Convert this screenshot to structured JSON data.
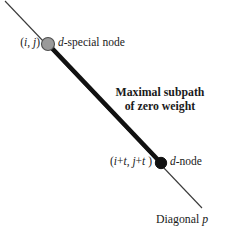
{
  "figure": {
    "background_color": "#ffffff",
    "width": 230,
    "height": 233
  },
  "diagonal": {
    "label_prefix": "Diagonal",
    "label_variable": "p",
    "thin_line_color": "#3a3a3a",
    "thin_line_width": 1,
    "start": {
      "x": 5,
      "y": 1
    },
    "end": {
      "x": 202,
      "y": 208
    }
  },
  "subpath": {
    "line_color": "#111111",
    "line_width": 4.6,
    "start": {
      "x": 48,
      "y": 44
    },
    "end": {
      "x": 161,
      "y": 163
    },
    "caption_line1": "Maximal subpath",
    "caption_line2": "of zero weight"
  },
  "nodes": [
    {
      "id": "d-special-node",
      "coord_open": "(",
      "coord_var1": "i",
      "coord_sep": ", ",
      "coord_var2": "j",
      "coord_close": ")",
      "type_var": "d",
      "type_text": "-special node",
      "fill": "#9a9a9a",
      "stroke": "#4a4a4a",
      "cx": 48,
      "cy": 44,
      "r": 6.6
    },
    {
      "id": "d-node",
      "coord_open": "(",
      "coord_var1": "i",
      "coord_plus1": "+",
      "coord_off1": "t",
      "coord_sep": ", ",
      "coord_var2": "j",
      "coord_plus2": "+",
      "coord_off2": "t",
      "coord_close": " )",
      "type_var": "d",
      "type_text": "-node",
      "fill": "#111111",
      "stroke": "#111111",
      "cx": 161,
      "cy": 163,
      "r": 5.6
    }
  ]
}
